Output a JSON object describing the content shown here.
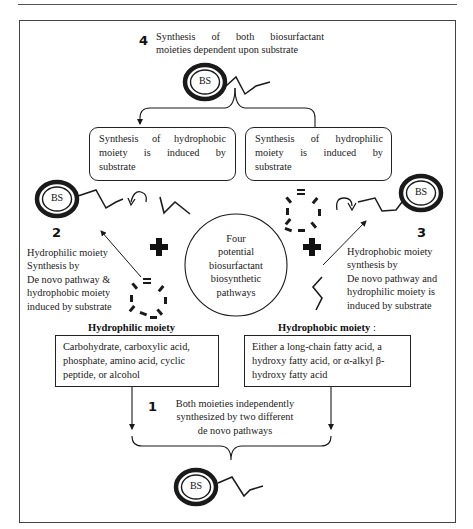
{
  "figure": {
    "title": "Four potential biosurfactant biosynthetic pathways",
    "center_label": [
      "Four",
      "potential",
      "biosurfactant",
      "biosynthetic",
      "pathways"
    ],
    "molecule_label": "BS",
    "pathways": [
      {
        "number": "1",
        "text": [
          "Both moieties independently",
          "synthesized by two different",
          "de novo pathways"
        ]
      },
      {
        "number": "2",
        "text": [
          "Hydrophilic moiety",
          "Synthesis by",
          "De novo pathway &",
          "hydrophobic moiety",
          "induced by substrate"
        ]
      },
      {
        "number": "3",
        "text": [
          "Hydrophobic moiety",
          "synthesis by",
          "De novo pathway and",
          "hydrophilic moiety is",
          "induced by substrate"
        ]
      },
      {
        "number": "4",
        "text": [
          "Synthesis of both biosurfactant",
          "moieties dependent upon substrate"
        ]
      }
    ],
    "induced_boxes": {
      "hydrophobic": [
        "Synthesis of hydrophobic",
        "moiety is induced by",
        "substrate"
      ],
      "hydrophilic": [
        "Synthesis of hydrophilic",
        "moiety is induced by",
        "substrate"
      ]
    },
    "moieties": {
      "hydrophilic": {
        "header": "Hydrophilic moiety",
        "text": [
          "Carbohydrate, carboxylic acid,",
          "phosphate, amino acid, cyclic",
          "peptide, or alcohol"
        ]
      },
      "hydrophobic": {
        "header": "Hydrophobic moiety",
        "header_suffix": " :",
        "text": [
          "Either a long-chain fatty acid, a",
          "hydroxy fatty acid, or α-alkyl β-",
          "hydroxy fatty acid"
        ]
      }
    },
    "symbols": {
      "plus": "+",
      "recycle": "↷"
    },
    "colors": {
      "line": "#1a1a1a",
      "frame": "#444444",
      "background": "#ffffff"
    }
  }
}
